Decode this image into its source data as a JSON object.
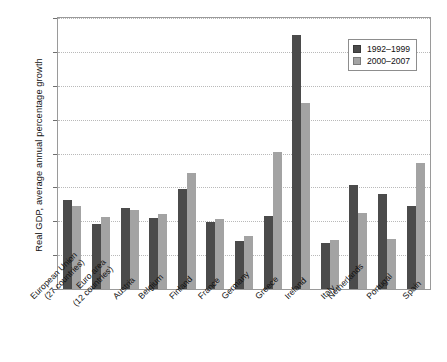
{
  "chart_data": {
    "type": "bar",
    "title": "",
    "xlabel": "",
    "ylabel": "Real GDP, average annual percentage growth",
    "ylim": [
      0,
      8
    ],
    "ytick_labels": [
      "0%",
      "1%",
      "2%",
      "3%",
      "4%",
      "5%",
      "6%",
      "7%",
      "8%"
    ],
    "ytick_values": [
      0,
      1,
      2,
      3,
      4,
      5,
      6,
      7,
      8
    ],
    "grid": true,
    "legend_position": "top-right",
    "categories": [
      "European Union (27 countries)",
      "Euro area (12 countries)",
      "Austria",
      "Belgium",
      "Finland",
      "France",
      "Germany",
      "Greece",
      "Ireland",
      "Italy",
      "Netherlands",
      "Portugal",
      "Spain"
    ],
    "category_lines": [
      [
        "European Union",
        "(27 countries)"
      ],
      [
        "Euro area",
        "(12 countries)"
      ],
      [
        "Austria",
        ""
      ],
      [
        "Belgium",
        ""
      ],
      [
        "Finland",
        ""
      ],
      [
        "France",
        ""
      ],
      [
        "Germany",
        ""
      ],
      [
        "Greece",
        ""
      ],
      [
        "Ireland",
        ""
      ],
      [
        "Italy",
        ""
      ],
      [
        "Netherlands",
        ""
      ],
      [
        "Portugal",
        ""
      ],
      [
        "Spain",
        ""
      ]
    ],
    "series": [
      {
        "name": "1992–1999",
        "color": "#4b4b4b",
        "values": [
          2.62,
          1.91,
          2.4,
          2.11,
          2.95,
          1.97,
          1.41,
          2.17,
          7.5,
          1.36,
          3.08,
          2.8,
          2.46
        ]
      },
      {
        "name": "2000–2007",
        "color": "#a3a3a3",
        "values": [
          2.46,
          2.14,
          2.34,
          2.2,
          3.43,
          2.08,
          1.56,
          4.05,
          5.49,
          1.44,
          2.24,
          1.47,
          3.71
        ]
      }
    ]
  }
}
